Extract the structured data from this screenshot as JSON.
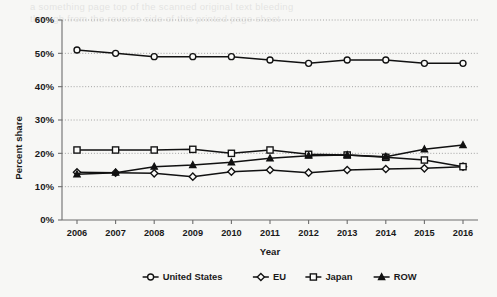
{
  "chart_data": {
    "type": "line",
    "title": "",
    "xlabel": "Year",
    "ylabel": "Percent share",
    "categories": [
      "2006",
      "2007",
      "2008",
      "2009",
      "2010",
      "2011",
      "2012",
      "2013",
      "2014",
      "2015",
      "2016"
    ],
    "ylim": [
      0,
      60
    ],
    "yticks": [
      0,
      10,
      20,
      30,
      40,
      50,
      60
    ],
    "ytick_labels": [
      "0%",
      "10%",
      "20%",
      "30%",
      "40%",
      "50%",
      "60%"
    ],
    "grid": true,
    "legend_position": "bottom",
    "series": [
      {
        "name": "United States",
        "marker": "circle-open",
        "values": [
          51.0,
          50.0,
          49.0,
          49.0,
          49.0,
          48.0,
          47.0,
          48.0,
          48.0,
          47.0,
          47.0
        ]
      },
      {
        "name": "EU",
        "marker": "diamond-open",
        "values": [
          14.3,
          14.2,
          14.0,
          13.0,
          14.5,
          15.0,
          14.2,
          15.0,
          15.3,
          15.5,
          16.0
        ]
      },
      {
        "name": "Japan",
        "marker": "square-open",
        "values": [
          21.0,
          21.0,
          21.0,
          21.2,
          20.0,
          21.0,
          19.7,
          19.5,
          18.8,
          18.0,
          16.0
        ]
      },
      {
        "name": "ROW",
        "marker": "triangle-solid",
        "values": [
          13.7,
          14.2,
          16.0,
          16.5,
          17.3,
          18.5,
          19.3,
          19.5,
          19.0,
          21.2,
          22.5
        ]
      }
    ],
    "colors": {
      "series_stroke": "#111111",
      "marker_fill": "#fbfbf9",
      "gridline": "#9a9a9a",
      "axis": "#6e6e6e",
      "background": "#f7f7f5"
    }
  },
  "legend": {
    "items": [
      {
        "label": "United States"
      },
      {
        "label": "EU"
      },
      {
        "label": "Japan"
      },
      {
        "label": "ROW"
      }
    ]
  },
  "page_bleed": {
    "line1": "a something page top of the scanned original text bleeding",
    "line2": "through from the reverse side of this printed page sheet"
  }
}
